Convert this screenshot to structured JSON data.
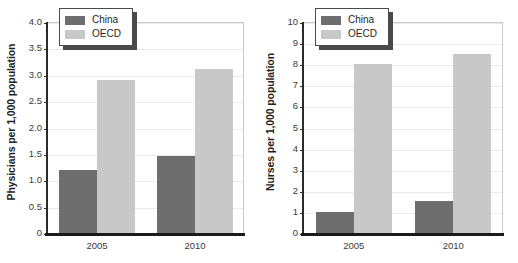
{
  "figure": {
    "background": "#ffffff",
    "panels": [
      "physicians",
      "nurses"
    ]
  },
  "colors": {
    "china": "#6e6e6e",
    "oecd": "#c8c8c8",
    "gridline": "#ebebeb",
    "axis": "#1b1b1b",
    "frame": "#c9c9c9",
    "text": "#231f20"
  },
  "legend": {
    "china_label": "China",
    "oecd_label": "OECD"
  },
  "chart_data": [
    {
      "type": "bar",
      "title": "",
      "xlabel": "",
      "ylabel": "Physicians per 1,000 population",
      "categories": [
        "2005",
        "2010"
      ],
      "series": [
        {
          "name": "China",
          "values": [
            1.2,
            1.46
          ],
          "color": "#6e6e6e"
        },
        {
          "name": "OECD",
          "values": [
            2.9,
            3.1
          ],
          "color": "#c8c8c8"
        }
      ],
      "ylim": [
        0,
        4.0
      ],
      "yticks": [
        "0",
        "0.5",
        "1.0",
        "1.5",
        "2.0",
        "2.5",
        "3.0",
        "3.5",
        "4.0"
      ],
      "ytick_values": [
        0,
        0.5,
        1.0,
        1.5,
        2.0,
        2.5,
        3.0,
        3.5,
        4.0
      ],
      "grid": true,
      "legend_position": "top-left"
    },
    {
      "type": "bar",
      "title": "",
      "xlabel": "",
      "ylabel": "Nurses per 1,000 population",
      "categories": [
        "2005",
        "2010"
      ],
      "series": [
        {
          "name": "China",
          "values": [
            1.0,
            1.5
          ],
          "color": "#6e6e6e"
        },
        {
          "name": "OECD",
          "values": [
            8.0,
            8.5
          ],
          "color": "#c8c8c8"
        }
      ],
      "ylim": [
        0,
        10
      ],
      "yticks": [
        "0",
        "1",
        "2",
        "3",
        "4",
        "5",
        "6",
        "7",
        "8",
        "9",
        "10"
      ],
      "ytick_values": [
        0,
        1,
        2,
        3,
        4,
        5,
        6,
        7,
        8,
        9,
        10
      ],
      "grid": true,
      "legend_position": "top-left"
    }
  ]
}
